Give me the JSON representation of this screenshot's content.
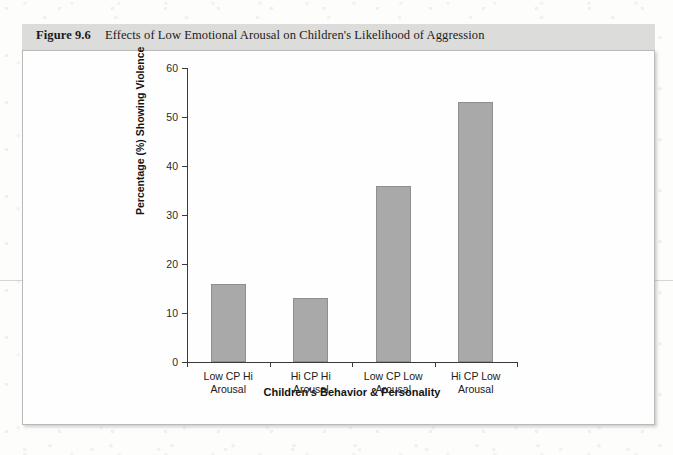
{
  "figure": {
    "number": "Figure 9.6",
    "title": "Effects of Low Emotional Arousal on Children's Likelihood of Aggression"
  },
  "chart_data": {
    "type": "bar",
    "title": "Effects of Low Emotional Arousal on Children's Likelihood of Aggression",
    "categories": [
      "Low CP Hi\nArousal",
      "Hi CP Hi\nArousal",
      "Low CP Low\nArousal",
      "Hi CP Low\nArousal"
    ],
    "category_lines": [
      [
        "Low CP Hi",
        "Arousal"
      ],
      [
        "Hi CP Hi",
        "Arousal"
      ],
      [
        "Low CP Low",
        "Arousal"
      ],
      [
        "Hi CP Low",
        "Arousal"
      ]
    ],
    "values": [
      16,
      13,
      36,
      53
    ],
    "xlabel": "Children's Behavior & Personality",
    "ylabel": "Percentage (%) Showing Violence",
    "ylim": [
      0,
      60
    ],
    "ytick_labels": [
      "0",
      "10",
      "20",
      "30",
      "40",
      "50",
      "60"
    ],
    "ytick_values": [
      0,
      10,
      20,
      30,
      40,
      50,
      60
    ],
    "grid": false,
    "legend": null,
    "bar_color": "#a9a9a9",
    "bar_edge_color": "#8e8e8e",
    "axis_color": "#3a3a3a"
  }
}
